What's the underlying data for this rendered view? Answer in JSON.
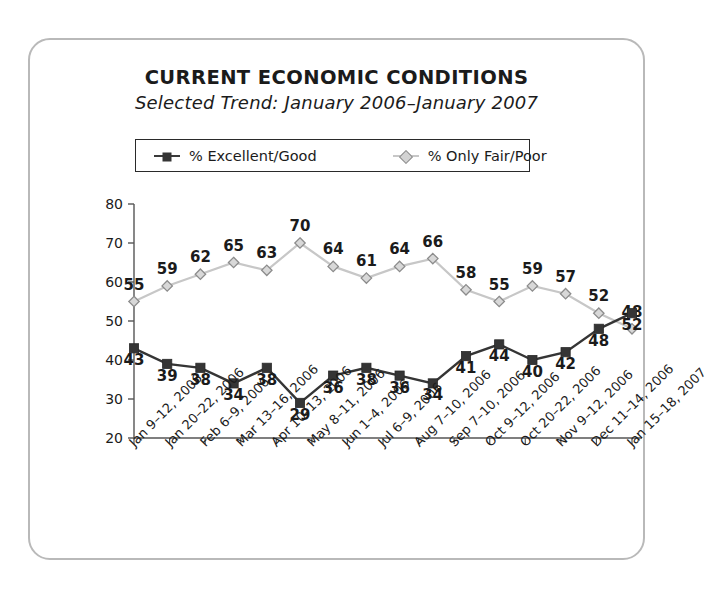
{
  "card": {
    "title": "CURRENT ECONOMIC CONDITIONS",
    "subtitle": "Selected Trend: January 2006–January 2007"
  },
  "legend": {
    "items": [
      {
        "label": "% Excellent/Good",
        "marker": "square-marker",
        "color": "#353535"
      },
      {
        "label": "% Only Fair/Poor",
        "marker": "diamond-marker",
        "color": "#c7c7c7"
      }
    ]
  },
  "chart_data": {
    "type": "line",
    "title": "CURRENT ECONOMIC CONDITIONS",
    "subtitle": "Selected Trend: January 2006–January 2007",
    "xlabel": "",
    "ylabel": "",
    "ylim": [
      20,
      80
    ],
    "yticks": [
      20,
      30,
      40,
      50,
      60,
      70,
      80
    ],
    "grid": false,
    "legend_position": "top",
    "categories": [
      "Jan 9–12, 2006",
      "Jan 20–22, 2006",
      "Feb 6–9, 2006",
      "Mar 13–16, 2006",
      "Apr 10–13, 2006",
      "May 8–11, 2006",
      "Jun 1–4, 2006",
      "Jul 6–9, 2006",
      "Aug 7–10, 2006",
      "Sep 7–10, 2006",
      "Oct 9–12, 2006",
      "Oct 20–22, 2006",
      "Nov 9–12, 2006",
      "Dec 11–14, 2006",
      "Jan 15–18, 2007"
    ],
    "series": [
      {
        "name": "% Excellent/Good",
        "color": "#353535",
        "marker": "square",
        "label_position": "below",
        "values": [
          43,
          39,
          38,
          34,
          38,
          29,
          36,
          38,
          36,
          34,
          41,
          44,
          40,
          42,
          48
        ],
        "final_value": 52
      },
      {
        "name": "% Only Fair/Poor",
        "color": "#c7c7c7",
        "marker": "diamond",
        "label_position": "above",
        "values": [
          55,
          59,
          62,
          65,
          63,
          70,
          64,
          61,
          64,
          66,
          58,
          55,
          59,
          57,
          52
        ],
        "final_value": 48
      }
    ]
  }
}
